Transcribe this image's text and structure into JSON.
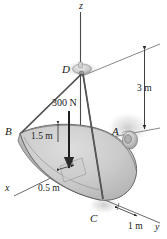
{
  "figure": {
    "type": "engineering-mechanics-free-body-diagram",
    "background_color": "#ffffff",
    "line_color": "#3c3c3c",
    "plate_fill": "#c9c9c9",
    "plate_edge_fill": "#b0b0b0",
    "plate_top_fill": "#d6d6d6",
    "cable_color": "#4a4a4a"
  },
  "axes": [
    {
      "name": "z-axis",
      "label": "z",
      "direction": "up"
    },
    {
      "name": "x-axis",
      "label": "x",
      "direction": "lower-left"
    },
    {
      "name": "y-axis",
      "label": "y",
      "direction": "lower-right"
    }
  ],
  "points": [
    {
      "name": "point-a",
      "label": "A",
      "description": "bearing / hinge support on right edge"
    },
    {
      "name": "point-b",
      "label": "B",
      "description": "left corner of plate, cable attachment"
    },
    {
      "name": "point-c",
      "label": "C",
      "description": "bottom corner of plate, cable attachment"
    },
    {
      "name": "point-d",
      "label": "D",
      "description": "cable junction / hook above plate"
    }
  ],
  "dimensions": [
    {
      "name": "height-dimension",
      "label": "3 m",
      "description": "vertical distance from support line up to D level"
    },
    {
      "name": "radius-dimension",
      "label": "1.5 m",
      "description": "plate radius measured from B edge"
    },
    {
      "name": "offset-dimension",
      "label": "0.5 m",
      "description": "offset along plate straight edge"
    },
    {
      "name": "width-dimension",
      "label": "1 m",
      "description": "distance along y axis to C"
    }
  ],
  "forces": [
    {
      "name": "applied-load",
      "label": "300 N",
      "direction": "downward",
      "description": "vertical load applied to the plate"
    }
  ]
}
